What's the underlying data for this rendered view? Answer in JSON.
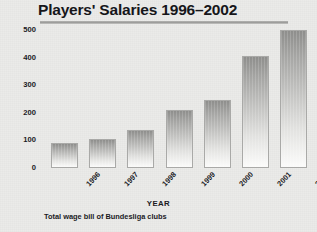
{
  "chart_data": {
    "type": "bar",
    "title": "Players' Salaries 1996–2002",
    "xlabel": "YEAR",
    "ylabel": "EUROS (MILLIONS)",
    "caption": "Total wage bill of Bundesliga clubs",
    "categories": [
      "1996",
      "1997",
      "1998",
      "1999",
      "2000",
      "2001",
      "2002"
    ],
    "values": [
      90,
      105,
      137,
      210,
      248,
      407,
      500
    ],
    "ylim": [
      0,
      500
    ],
    "ytick_labels": [
      "500",
      "400",
      "300",
      "200",
      "100",
      "0"
    ],
    "ytick_values": [
      500,
      400,
      300,
      200,
      100,
      0
    ],
    "grid": false,
    "legend": "none",
    "series_color_top": "#8e8e8c",
    "series_color_bottom": "#fbfbfa",
    "bar_outline_color": "#a9a9a7",
    "background_color": "#ebebe9",
    "text_color": "#1b1b1f"
  }
}
